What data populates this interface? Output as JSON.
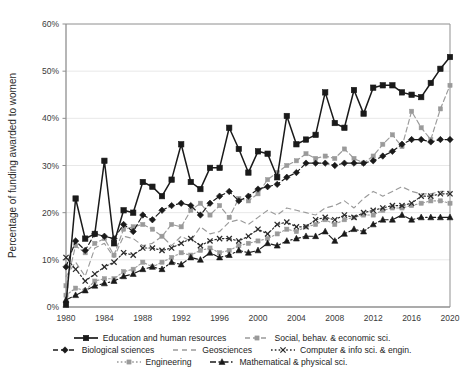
{
  "chart_data": {
    "type": "line",
    "title": "",
    "xlabel": "",
    "ylabel": "Percentage of funding awarded to women",
    "xlim": [
      1980,
      2020
    ],
    "ylim": [
      0,
      60
    ],
    "ytick_labels": [
      "0%",
      "10%",
      "20%",
      "30%",
      "40%",
      "50%",
      "60%"
    ],
    "ytick_values": [
      0,
      10,
      20,
      30,
      40,
      50,
      60
    ],
    "xtick_labels": [
      "1980",
      "1984",
      "1988",
      "1992",
      "1996",
      "2000",
      "2004",
      "2008",
      "2012",
      "2016",
      "2020"
    ],
    "xtick_values": [
      1980,
      1984,
      1988,
      1992,
      1996,
      2000,
      2004,
      2008,
      2012,
      2016,
      2020
    ],
    "grid": "horizontal",
    "legend_position": "bottom",
    "x": [
      1980,
      1981,
      1982,
      1983,
      1984,
      1985,
      1986,
      1987,
      1988,
      1989,
      1990,
      1991,
      1992,
      1993,
      1994,
      1995,
      1996,
      1997,
      1998,
      1999,
      2000,
      2001,
      2002,
      2003,
      2004,
      2005,
      2006,
      2007,
      2008,
      2009,
      2010,
      2011,
      2012,
      2013,
      2014,
      2015,
      2016,
      2017,
      2018,
      2019,
      2020
    ],
    "series": [
      {
        "name": "Education and human resources",
        "color": "#1a1a1a",
        "dash": "none",
        "marker": "square",
        "values": [
          0.5,
          23.0,
          14.5,
          15.5,
          31.0,
          13.5,
          20.5,
          20.0,
          26.5,
          25.5,
          23.5,
          27.0,
          34.5,
          26.5,
          25.0,
          29.5,
          29.5,
          38.0,
          33.5,
          28.5,
          33.0,
          32.5,
          27.5,
          40.5,
          34.5,
          35.5,
          36.5,
          45.5,
          39.0,
          38.0,
          46.0,
          41.0,
          46.5,
          47.0,
          47.0,
          45.5,
          45.0,
          44.5,
          47.5,
          50.5,
          53.0
        ]
      },
      {
        "name": "Social, behav. & economic sci.",
        "color": "#9a9a9a",
        "dash": "dashed",
        "marker": "square-small",
        "values": [
          4.5,
          13.0,
          11.5,
          13.5,
          14.5,
          11.0,
          16.5,
          17.0,
          17.5,
          16.5,
          15.0,
          17.5,
          17.0,
          20.5,
          22.0,
          19.5,
          21.5,
          19.0,
          23.0,
          22.5,
          24.0,
          27.0,
          28.5,
          30.0,
          31.0,
          32.5,
          31.5,
          32.0,
          31.5,
          33.5,
          31.5,
          30.5,
          32.0,
          34.5,
          36.5,
          34.0,
          41.5,
          38.0,
          35.5,
          42.0,
          47.0
        ]
      },
      {
        "name": "Biological sciences",
        "color": "#1a1a1a",
        "dash": "dashed",
        "marker": "diamond",
        "values": [
          8.5,
          14.0,
          12.0,
          15.5,
          15.0,
          14.5,
          17.5,
          16.0,
          19.5,
          18.5,
          20.5,
          21.5,
          22.0,
          21.5,
          19.5,
          22.0,
          23.5,
          24.5,
          22.5,
          23.5,
          25.0,
          25.5,
          26.0,
          27.5,
          28.5,
          30.5,
          30.5,
          30.5,
          30.0,
          30.5,
          30.5,
          30.5,
          31.0,
          32.0,
          33.0,
          34.5,
          35.5,
          35.5,
          35.0,
          35.5,
          35.5
        ]
      },
      {
        "name": "Geosciences",
        "color": "#9a9a9a",
        "dash": "dashed-plain",
        "marker": "none",
        "values": [
          6.5,
          9.5,
          6.5,
          12.5,
          13.5,
          10.5,
          15.0,
          14.5,
          13.0,
          13.5,
          15.0,
          13.0,
          15.0,
          14.0,
          17.0,
          15.5,
          16.0,
          18.0,
          18.5,
          17.5,
          19.0,
          20.5,
          19.5,
          21.0,
          20.5,
          20.0,
          19.5,
          21.0,
          21.5,
          22.5,
          21.0,
          23.0,
          24.5,
          23.5,
          24.5,
          25.5,
          24.5,
          24.0,
          24.0,
          24.5,
          24.5
        ]
      },
      {
        "name": "Computer & info sci. & engin.",
        "color": "#2a2a2a",
        "dash": "dotted",
        "marker": "x",
        "values": [
          10.5,
          8.0,
          5.5,
          7.0,
          8.5,
          9.5,
          11.5,
          11.0,
          12.5,
          12.5,
          12.0,
          12.5,
          13.5,
          14.5,
          13.0,
          14.0,
          14.5,
          14.5,
          14.0,
          15.0,
          16.5,
          15.5,
          17.5,
          18.0,
          17.0,
          17.0,
          18.5,
          19.0,
          18.5,
          19.5,
          19.0,
          20.0,
          20.5,
          21.0,
          21.5,
          21.5,
          22.0,
          23.5,
          23.5,
          24.0,
          24.0
        ]
      },
      {
        "name": "Engineering",
        "color": "#9a9a9a",
        "dash": "dotted",
        "marker": "square-small",
        "values": [
          2.5,
          4.0,
          3.5,
          5.5,
          6.0,
          6.0,
          7.5,
          8.0,
          9.5,
          8.5,
          9.5,
          10.5,
          11.5,
          11.0,
          12.0,
          12.5,
          11.5,
          12.0,
          13.0,
          13.5,
          14.0,
          14.5,
          15.5,
          16.5,
          16.0,
          17.0,
          17.5,
          18.5,
          17.5,
          18.5,
          19.0,
          19.5,
          19.5,
          20.5,
          21.0,
          21.0,
          21.5,
          22.0,
          22.5,
          22.5,
          22.0
        ]
      },
      {
        "name": "Mathematical & physical sci.",
        "color": "#1a1a1a",
        "dash": "dashdot",
        "marker": "triangle",
        "values": [
          1.5,
          2.5,
          3.5,
          4.5,
          5.0,
          5.5,
          6.5,
          7.0,
          8.0,
          8.5,
          8.0,
          9.5,
          9.0,
          10.5,
          10.0,
          11.5,
          10.5,
          11.0,
          12.0,
          11.5,
          12.0,
          13.5,
          13.0,
          14.0,
          14.5,
          15.0,
          15.0,
          16.0,
          14.0,
          15.5,
          16.5,
          16.0,
          17.5,
          18.5,
          18.5,
          19.5,
          18.5,
          19.0,
          19.0,
          19.0,
          19.0
        ]
      }
    ]
  },
  "legend": {
    "rows": [
      [
        {
          "label": "Education and human resources",
          "series_index": 0
        },
        {
          "label": "Social, behav. & economic sci.",
          "series_index": 1
        }
      ],
      [
        {
          "label": "Biological sciences",
          "series_index": 2
        },
        {
          "label": "Geosciences",
          "series_index": 3
        },
        {
          "label": "Computer & info sci. & engin.",
          "series_index": 4
        }
      ],
      [
        {
          "label": "Engineering",
          "series_index": 5
        },
        {
          "label": "Mathematical & physical sci.",
          "series_index": 6
        }
      ]
    ]
  },
  "style": {
    "plot_border_color": "#9a9a9a",
    "gridline_color": "#e8e8e8",
    "background": "#ffffff"
  }
}
